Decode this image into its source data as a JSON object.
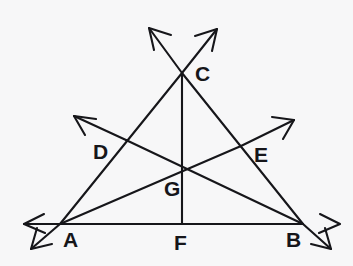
{
  "figure": {
    "background_color": "#f7f7f8",
    "ink_color": "#16161a",
    "canvas": {
      "width": 353,
      "height": 266
    }
  },
  "labels": {
    "A": "A",
    "B": "B",
    "C": "C",
    "D": "D",
    "E": "E",
    "F": "F",
    "G": "G"
  },
  "points": {
    "A": {
      "x": 60,
      "y": 224,
      "label": "A",
      "label_x": 63,
      "label_y": 247,
      "role": "triangle-vertex"
    },
    "B": {
      "x": 303,
      "y": 224,
      "label": "B",
      "label_x": 286,
      "label_y": 247,
      "role": "triangle-vertex"
    },
    "C": {
      "x": 182,
      "y": 73,
      "label": "C",
      "label_x": 195,
      "label_y": 81,
      "role": "triangle-vertex"
    },
    "D": {
      "x": 126,
      "y": 140,
      "label": "D",
      "label_x": 94,
      "label_y": 158,
      "role": "midpoint-of-AC"
    },
    "E": {
      "x": 241,
      "y": 146,
      "label": "E",
      "label_x": 255,
      "label_y": 161,
      "role": "midpoint-of-BC"
    },
    "F": {
      "x": 182,
      "y": 224,
      "label": "F",
      "label_x": 174,
      "label_y": 249,
      "role": "midpoint-of-AB"
    },
    "G": {
      "x": 182,
      "y": 168,
      "label": "G",
      "label_x": 165,
      "label_y": 195,
      "role": "centroid"
    }
  },
  "segments": [
    {
      "name": "side-AB",
      "from": "A",
      "to": "B",
      "x1": 60,
      "y1": 224,
      "x2": 303,
      "y2": 224
    },
    {
      "name": "side-AC",
      "from": "A",
      "to": "C",
      "x1": 60,
      "y1": 224,
      "x2": 182,
      "y2": 73
    },
    {
      "name": "side-BC",
      "from": "B",
      "to": "C",
      "x1": 303,
      "y1": 224,
      "x2": 182,
      "y2": 73
    },
    {
      "name": "median-CF",
      "from": "C",
      "to": "F",
      "x1": 182,
      "y1": 73,
      "x2": 182,
      "y2": 224
    },
    {
      "name": "median-AE",
      "from": "A",
      "to": "E",
      "x1": 60,
      "y1": 224,
      "x2": 241,
      "y2": 146
    },
    {
      "name": "median-BD",
      "from": "B",
      "to": "D",
      "x1": 303,
      "y1": 224,
      "x2": 126,
      "y2": 140
    }
  ],
  "rays": [
    {
      "name": "ray-A-through-C-extended",
      "x1": 60,
      "y1": 224,
      "x2": 148,
      "y2": 27,
      "tip_x": 148,
      "tip_y": 27
    },
    {
      "name": "ray-B-through-C-extended",
      "x1": 303,
      "y1": 224,
      "x2": 218,
      "y2": 28,
      "tip_x": 218,
      "tip_y": 28
    },
    {
      "name": "ray-B-through-D-extended",
      "x1": 303,
      "y1": 224,
      "x2": 73,
      "y2": 115,
      "tip_x": 73,
      "tip_y": 115
    },
    {
      "name": "ray-A-through-E-extended",
      "x1": 60,
      "y1": 224,
      "x2": 295,
      "y2": 119,
      "tip_x": 295,
      "tip_y": 119
    },
    {
      "name": "ray-AB-extended-left",
      "x1": 303,
      "y1": 224,
      "x2": 24,
      "y2": 224,
      "tip_x": 24,
      "tip_y": 224
    },
    {
      "name": "ray-AB-extended-right",
      "x1": 60,
      "y1": 224,
      "x2": 340,
      "y2": 224,
      "tip_x": 340,
      "tip_y": 224
    },
    {
      "name": "ray-from-A-down-left",
      "x1": 60,
      "y1": 224,
      "x2": 30,
      "y2": 250,
      "tip_x": 30,
      "tip_y": 250
    },
    {
      "name": "ray-from-B-down-right",
      "x1": 303,
      "y1": 224,
      "x2": 332,
      "y2": 250,
      "tip_x": 332,
      "tip_y": 250
    }
  ],
  "annotations": {
    "concurrency_point": "G",
    "cevian_count": 3,
    "arrowhead_count": 8
  }
}
